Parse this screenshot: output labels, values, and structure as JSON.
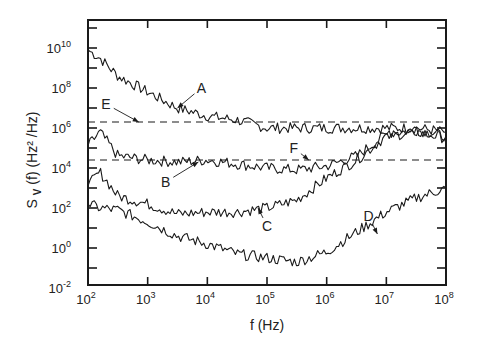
{
  "chart_data": {
    "type": "line",
    "title": "",
    "xlabel": "f (Hz)",
    "ylabel": "S_V (f)   (Hz² /Hz)",
    "xscale": "log",
    "yscale": "log",
    "xlim": [
      100,
      100000000
    ],
    "ylim": [
      0.01,
      100000000000
    ],
    "grid": false,
    "legend": "none (curves labeled inline with arrows)",
    "x_ticks": [
      "10^2",
      "10^3",
      "10^4",
      "10^5",
      "10^6",
      "10^7",
      "10^8"
    ],
    "y_ticks": [
      "10^-2",
      "10^0",
      "10^2",
      "10^4",
      "10^6",
      "10^8",
      "10^10"
    ],
    "x_tick_labels": [
      {
        "base": "10",
        "exp": "2"
      },
      {
        "base": "10",
        "exp": "3"
      },
      {
        "base": "10",
        "exp": "4"
      },
      {
        "base": "10",
        "exp": "5"
      },
      {
        "base": "10",
        "exp": "6"
      },
      {
        "base": "10",
        "exp": "7"
      },
      {
        "base": "10",
        "exp": "8"
      }
    ],
    "y_tick_labels": [
      {
        "base": "10",
        "exp": "-2",
        "log": -2
      },
      {
        "base": "10",
        "exp": "0",
        "log": 0
      },
      {
        "base": "10",
        "exp": "2",
        "log": 2
      },
      {
        "base": "10",
        "exp": "4",
        "log": 4
      },
      {
        "base": "10",
        "exp": "6",
        "log": 6
      },
      {
        "base": "10",
        "exp": "8",
        "log": 8
      },
      {
        "base": "10",
        "exp": "10",
        "log": 10
      }
    ],
    "x_log10": [
      2.0,
      2.2,
      2.5,
      3.0,
      3.5,
      4.0,
      4.5,
      5.0,
      5.5,
      6.0,
      6.5,
      7.0,
      7.5,
      8.0
    ],
    "series": [
      {
        "name": "A",
        "style": "solid",
        "log10_values": [
          9.9,
          9.5,
          8.6,
          7.8,
          7.0,
          6.6,
          6.4,
          6.0,
          6.0,
          6.0,
          6.0,
          6.0,
          6.0,
          5.8
        ]
      },
      {
        "name": "B",
        "style": "solid",
        "log10_values": [
          5.1,
          5.8,
          4.6,
          4.4,
          4.3,
          4.4,
          4.2,
          4.0,
          3.9,
          4.1,
          4.6,
          5.7,
          5.9,
          5.6
        ]
      },
      {
        "name": "C",
        "style": "solid",
        "log10_values": [
          3.1,
          3.8,
          2.6,
          2.2,
          1.7,
          1.8,
          1.8,
          2.0,
          2.4,
          3.5,
          4.4,
          5.6,
          5.8,
          5.5
        ]
      },
      {
        "name": "D",
        "style": "solid",
        "log10_values": [
          2.2,
          2.0,
          1.9,
          1.3,
          0.6,
          0.2,
          -0.3,
          -0.5,
          -0.7,
          -0.2,
          0.8,
          1.8,
          2.5,
          3.0
        ]
      },
      {
        "name": "E",
        "style": "dashed",
        "log10_values": [
          6.3,
          6.3,
          6.3,
          6.3,
          6.3,
          6.3,
          6.3,
          6.3,
          6.3,
          6.3,
          6.3,
          6.3,
          6.3,
          6.3
        ]
      },
      {
        "name": "F",
        "style": "dashed",
        "log10_values": [
          4.4,
          4.4,
          4.4,
          4.4,
          4.4,
          4.4,
          4.4,
          4.4,
          4.4,
          4.4,
          4.4,
          4.4,
          4.4,
          4.4
        ]
      }
    ],
    "annotations": [
      {
        "label": "A",
        "text_at": [
          3.9,
          8.0
        ],
        "arrow_to": [
          3.5,
          7.0
        ]
      },
      {
        "label": "E",
        "text_at": [
          2.3,
          7.2
        ],
        "arrow_to": [
          2.85,
          6.3
        ]
      },
      {
        "label": "F",
        "text_at": [
          5.45,
          5.0
        ],
        "arrow_to": [
          5.7,
          4.4
        ]
      },
      {
        "label": "B",
        "text_at": [
          3.3,
          3.3
        ],
        "arrow_to": [
          3.85,
          4.3
        ]
      },
      {
        "label": "C",
        "text_at": [
          5.0,
          1.1
        ],
        "arrow_to": [
          4.85,
          2.0
        ]
      },
      {
        "label": "D",
        "text_at": [
          6.7,
          1.6
        ],
        "arrow_to": [
          6.85,
          0.7
        ]
      }
    ],
    "colors": {
      "line": "#1a1a1a",
      "axis": "#1a1a1a",
      "background": "#ffffff"
    }
  }
}
